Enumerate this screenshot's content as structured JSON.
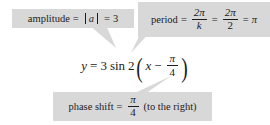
{
  "figure": {
    "kind": "annotated-equation-diagram",
    "background_color": "#ffffff",
    "callout_fill": "#d8d8d8",
    "text_color": "#1c1c1c"
  },
  "equation": {
    "lhs": "y",
    "equals": "=",
    "amplitude_value": "3",
    "function": "sin",
    "k_value": "2",
    "variable": "x",
    "minus": "−",
    "shift_numerator": "π",
    "shift_denominator": "4",
    "open_paren": "(",
    "close_paren": ")",
    "full_text": "y = 3 sin 2(x − π/4)"
  },
  "callouts": {
    "amplitude": {
      "label": "amplitude",
      "equals_1": "=",
      "abs_open": "|",
      "abs_symbol": "a",
      "abs_close": "|",
      "equals_2": "=",
      "value": "3",
      "full_text": "amplitude = | a | = 3"
    },
    "period": {
      "label": "period",
      "equals_1": "=",
      "frac1_numerator": "2π",
      "frac1_denominator": "k",
      "equals_2": "=",
      "frac2_numerator": "2π",
      "frac2_denominator": "2",
      "equals_3": "=",
      "result": "π",
      "full_text": "period = 2π/k = 2π/2 = π"
    },
    "phase_shift": {
      "label": "phase shift",
      "equals": "=",
      "frac_numerator": "π",
      "frac_denominator": "4",
      "direction": "(to the right)",
      "full_text": "phase shift = π/4 (to the right)"
    }
  }
}
